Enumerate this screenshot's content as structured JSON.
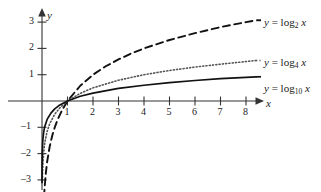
{
  "chart_data": {
    "type": "line",
    "title": "",
    "xlabel": "x",
    "ylabel": "y",
    "xlim": [
      0,
      8.5
    ],
    "ylim": [
      -3.4,
      3.4
    ],
    "grid": false,
    "legend_position": "right-inline",
    "xticks": [
      "1",
      "2",
      "3",
      "4",
      "5",
      "6",
      "7",
      "8"
    ],
    "xtick_values": [
      1,
      2,
      3,
      4,
      5,
      6,
      7,
      8
    ],
    "yticks": [
      "3",
      "2",
      "1",
      "-1",
      "-2",
      "-3"
    ],
    "ytick_values": [
      3,
      2,
      1,
      -1,
      -2,
      -3
    ],
    "annotations": [
      "All three curves pass through (1, 0)"
    ],
    "series": [
      {
        "name": "y = log_2 x",
        "label_html": "y = log<sub>2</sub> x",
        "base": 2,
        "style": "dashed",
        "color": "#111111",
        "x": [
          0.08,
          0.1,
          0.15,
          0.2,
          0.3,
          0.4,
          0.5,
          0.6,
          0.8,
          1.0,
          1.5,
          2.0,
          2.5,
          3.0,
          3.5,
          4.0,
          5.0,
          6.0,
          7.0,
          8.0,
          8.4
        ],
        "y": [
          -3.64,
          -3.32,
          -2.74,
          -2.32,
          -1.74,
          -1.32,
          -1.0,
          -0.74,
          -0.32,
          0.0,
          0.58,
          1.0,
          1.32,
          1.58,
          1.81,
          2.0,
          2.32,
          2.58,
          2.81,
          3.0,
          3.07
        ]
      },
      {
        "name": "y = log_4 x",
        "label_html": "y = log<sub>4</sub> x",
        "base": 4,
        "style": "dotted",
        "color": "#555555",
        "x": [
          0.015,
          0.02,
          0.04,
          0.08,
          0.12,
          0.2,
          0.3,
          0.5,
          0.7,
          1.0,
          1.5,
          2.0,
          3.0,
          4.0,
          5.0,
          6.0,
          7.0,
          8.0,
          8.4
        ],
        "y": [
          -3.03,
          -2.82,
          -2.32,
          -1.82,
          -1.53,
          -1.16,
          -0.87,
          -0.5,
          -0.26,
          0.0,
          0.29,
          0.5,
          0.79,
          1.0,
          1.16,
          1.29,
          1.4,
          1.5,
          1.54
        ]
      },
      {
        "name": "y = log_10 x",
        "label_html": "y = log<sub>10</sub> x",
        "base": 10,
        "style": "solid",
        "color": "#111111",
        "x": [
          0.0008,
          0.002,
          0.005,
          0.01,
          0.03,
          0.06,
          0.1,
          0.2,
          0.35,
          0.5,
          0.7,
          1.0,
          1.5,
          2.0,
          3.0,
          4.0,
          5.0,
          6.0,
          7.0,
          8.0,
          8.4
        ],
        "y": [
          -3.1,
          -2.7,
          -2.3,
          -2.0,
          -1.52,
          -1.22,
          -1.0,
          -0.7,
          -0.46,
          -0.3,
          -0.15,
          0.0,
          0.18,
          0.3,
          0.48,
          0.6,
          0.7,
          0.78,
          0.85,
          0.9,
          0.92
        ]
      }
    ]
  },
  "axes": {
    "x_axis_name": "x",
    "y_axis_name": "y"
  },
  "labels": {
    "log2": {
      "lhs": "y",
      "eq": "=",
      "fn": "log",
      "sub": "2",
      "arg": "x"
    },
    "log4": {
      "lhs": "y",
      "eq": "=",
      "fn": "log",
      "sub": "4",
      "arg": "x"
    },
    "log10": {
      "lhs": "y",
      "eq": "=",
      "fn": "log",
      "sub": "10",
      "arg": "x"
    }
  },
  "ticks": {
    "x": [
      {
        "label": "1"
      },
      {
        "label": "2"
      },
      {
        "label": "3"
      },
      {
        "label": "4"
      },
      {
        "label": "5"
      },
      {
        "label": "6"
      },
      {
        "label": "7"
      },
      {
        "label": "8"
      }
    ],
    "y_pos": [
      {
        "label": "3"
      },
      {
        "label": "2"
      },
      {
        "label": "1"
      }
    ],
    "y_neg": [
      {
        "label": "–1"
      },
      {
        "label": "–2"
      },
      {
        "label": "–3"
      }
    ]
  }
}
